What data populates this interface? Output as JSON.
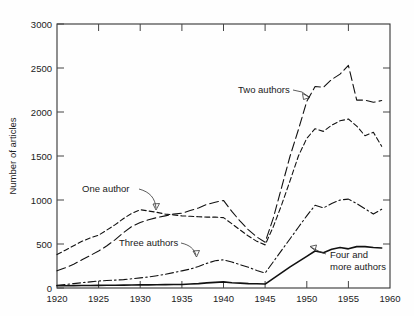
{
  "chart_data": {
    "type": "line",
    "title": "",
    "xlabel": "",
    "ylabel": "Number of articles",
    "xlim": [
      1920,
      1960
    ],
    "ylim": [
      0,
      3000
    ],
    "xticks": [
      1920,
      1925,
      1930,
      1935,
      1940,
      1945,
      1950,
      1955,
      1960
    ],
    "yticks": [
      0,
      500,
      1000,
      1500,
      2000,
      2500,
      3000
    ],
    "grid": false,
    "legend_position": "inline-annotations",
    "x": [
      1920,
      1921,
      1922,
      1923,
      1924,
      1925,
      1926,
      1927,
      1928,
      1929,
      1930,
      1931,
      1932,
      1933,
      1934,
      1935,
      1936,
      1937,
      1938,
      1939,
      1940,
      1941,
      1942,
      1943,
      1944,
      1945,
      1946,
      1947,
      1948,
      1949,
      1950,
      1951,
      1952,
      1953,
      1954,
      1955,
      1956,
      1957,
      1958,
      1959
    ],
    "series": [
      {
        "name": "One author",
        "style": "short-dashed",
        "values": [
          380,
          430,
          480,
          530,
          570,
          600,
          660,
          720,
          790,
          850,
          890,
          875,
          860,
          840,
          830,
          820,
          815,
          810,
          805,
          805,
          800,
          730,
          660,
          590,
          530,
          490,
          700,
          950,
          1220,
          1500,
          1700,
          1810,
          1780,
          1850,
          1900,
          1920,
          1840,
          1730,
          1770,
          1610
        ]
      },
      {
        "name": "Two authors",
        "style": "long-dashed",
        "values": [
          195,
          230,
          270,
          320,
          370,
          420,
          480,
          550,
          630,
          700,
          745,
          775,
          800,
          820,
          840,
          850,
          880,
          910,
          950,
          975,
          995,
          870,
          760,
          660,
          580,
          520,
          800,
          1150,
          1500,
          1800,
          2120,
          2290,
          2280,
          2370,
          2430,
          2530,
          2135,
          2135,
          2110,
          2130
        ]
      },
      {
        "name": "Three authors",
        "style": "dash-dot",
        "values": [
          30,
          40,
          50,
          60,
          70,
          80,
          85,
          90,
          95,
          105,
          115,
          125,
          140,
          155,
          175,
          195,
          215,
          245,
          280,
          310,
          320,
          295,
          265,
          235,
          200,
          170,
          300,
          430,
          560,
          690,
          820,
          940,
          910,
          960,
          1000,
          1010,
          960,
          900,
          840,
          895
        ]
      },
      {
        "name": "Four and more authors",
        "style": "solid",
        "values": [
          25,
          26,
          27,
          28,
          29,
          30,
          31,
          32,
          33,
          34,
          35,
          36,
          37,
          38,
          39,
          40,
          45,
          50,
          58,
          64,
          70,
          60,
          55,
          50,
          48,
          45,
          110,
          175,
          240,
          300,
          360,
          420,
          400,
          440,
          460,
          445,
          470,
          470,
          460,
          455
        ]
      }
    ],
    "annotations": [
      {
        "label": "One author",
        "x": 1929,
        "y": 1150
      },
      {
        "label": "Two authors",
        "x": 1943,
        "y": 2190
      },
      {
        "label": "Three authors",
        "x": 1934,
        "y": 390
      },
      {
        "label": "Four and",
        "x": 1955,
        "y": 300
      },
      {
        "label": "more authors",
        "x": 1955,
        "y": 215
      }
    ]
  },
  "axis": {
    "y_title": "Number of articles",
    "y_tick_labels": [
      "3000",
      "2500",
      "2000",
      "1500",
      "1000",
      "500",
      "0"
    ],
    "x_tick_labels": [
      "1920",
      "1925",
      "1930",
      "1935",
      "1940",
      "1945",
      "1950",
      "1955",
      "1960"
    ]
  },
  "labels": {
    "one_author": "One author",
    "two_authors": "Two authors",
    "three_authors": "Three authors",
    "four_and": "Four and",
    "more_authors": "more authors"
  }
}
